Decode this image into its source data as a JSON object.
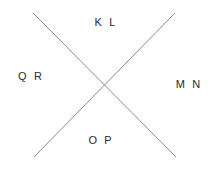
{
  "canvas": {
    "width": 215,
    "height": 171,
    "background_color": "#ffffff"
  },
  "diagram": {
    "type": "x-cross-with-quadrant-labels",
    "line_color": "#8a8a8a",
    "line_width": 1,
    "text_color": "#2a2a2a",
    "crossing_point": {
      "x": 105,
      "y": 86
    },
    "lines": [
      {
        "name": "line-top-left-to-bottom-right",
        "x1": 33,
        "y1": 13,
        "x2": 176,
        "y2": 157
      },
      {
        "name": "line-top-right-to-bottom-left",
        "x1": 175,
        "y1": 13,
        "x2": 34,
        "y2": 157
      }
    ],
    "labels": {
      "top": "K L",
      "left": "Q R",
      "right": "M N",
      "bottom": "O P"
    }
  }
}
